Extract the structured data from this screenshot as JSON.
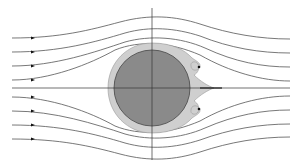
{
  "diagram": {
    "type": "flow-around-cylinder",
    "colors": {
      "background": "#ffffff",
      "streamline": "#555555",
      "axis": "#333333",
      "cylinder_fill": "#8a8a8a",
      "cylinder_stroke": "#444444",
      "boundary_layer_fill": "#cfcfcf",
      "boundary_layer_stroke": "#9a9a9a",
      "arrow": "#111111"
    },
    "axes": {
      "horizontal": {
        "x1": 12,
        "x2": 290,
        "y": 88
      },
      "vertical": {
        "x": 152,
        "y1": 8,
        "y2": 160
      }
    },
    "cylinder": {
      "cx": 152,
      "cy": 88,
      "r": 38
    },
    "streamlines": {
      "count": 8,
      "left_y": [
        38,
        52,
        66,
        80,
        97,
        111,
        125,
        139
      ],
      "right_y": [
        39,
        53,
        67,
        81,
        96,
        110,
        124,
        137
      ],
      "arrow_x": 33
    },
    "labels": []
  }
}
